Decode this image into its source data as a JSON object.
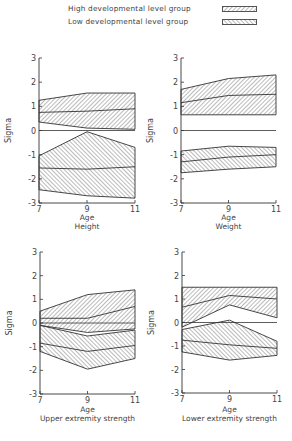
{
  "legend": {
    "items": [
      {
        "label": "High developmental level group",
        "pattern": "forward-hatch"
      },
      {
        "label": "Low developmental level group",
        "pattern": "back-hatch"
      }
    ]
  },
  "colors": {
    "line": "#333333",
    "hatch": "#555555",
    "text": "#444444",
    "background": "#ffffff"
  },
  "chart_data": [
    {
      "type": "area",
      "title": "Height",
      "xlabel": "Age",
      "ylabel": "Sigma",
      "x": [
        7,
        9,
        11
      ],
      "xticks": [
        "7",
        "9",
        "11"
      ],
      "yticks": [
        "3",
        "2",
        "1",
        "0",
        "-1",
        "-2",
        "-3"
      ],
      "ylim": [
        -3,
        3
      ],
      "grid": false,
      "series": [
        {
          "name": "High developmental level group",
          "upper": [
            1.25,
            1.55,
            1.55
          ],
          "mean": [
            0.75,
            0.8,
            0.9
          ],
          "lower": [
            0.35,
            0.1,
            0.05
          ]
        },
        {
          "name": "Low developmental level group",
          "upper": [
            -1.05,
            -0.05,
            -0.7
          ],
          "mean": [
            -1.55,
            -1.6,
            -1.5
          ],
          "lower": [
            -2.45,
            -2.7,
            -2.8
          ]
        }
      ]
    },
    {
      "type": "area",
      "title": "Weight",
      "xlabel": "Age",
      "ylabel": "Sigma",
      "x": [
        7,
        9,
        11
      ],
      "xticks": [
        "7",
        "9",
        "11"
      ],
      "yticks": [
        "3",
        "2",
        "1",
        "0",
        "-1",
        "-2",
        "-3"
      ],
      "ylim": [
        -3,
        3
      ],
      "grid": false,
      "series": [
        {
          "name": "High developmental level group",
          "upper": [
            1.7,
            2.15,
            2.3
          ],
          "mean": [
            1.15,
            1.45,
            1.5
          ],
          "lower": [
            0.65,
            0.65,
            0.65
          ]
        },
        {
          "name": "Low developmental level group",
          "upper": [
            -0.85,
            -0.65,
            -0.7
          ],
          "mean": [
            -1.3,
            -1.1,
            -1.0
          ],
          "lower": [
            -1.75,
            -1.6,
            -1.5
          ]
        }
      ]
    },
    {
      "type": "area",
      "title": "Upper extremity strength",
      "xlabel": "Age",
      "ylabel": "Sigma",
      "x": [
        7,
        9,
        11
      ],
      "xticks": [
        "7",
        "9",
        "11"
      ],
      "yticks": [
        "3",
        "2",
        "1",
        "0",
        "-1",
        "-2",
        "-3"
      ],
      "ylim": [
        -3,
        3
      ],
      "grid": false,
      "series": [
        {
          "name": "High developmental level group",
          "upper": [
            0.5,
            1.2,
            1.4
          ],
          "mean": [
            0.2,
            0.2,
            0.7
          ],
          "lower": [
            -0.1,
            -0.4,
            -0.25
          ]
        },
        {
          "name": "Low developmental level group",
          "upper": [
            -0.1,
            -0.55,
            -0.3
          ],
          "mean": [
            -0.85,
            -1.2,
            -0.95
          ],
          "lower": [
            -1.2,
            -1.95,
            -1.5
          ]
        }
      ]
    },
    {
      "type": "area",
      "title": "Lower extremity strength",
      "xlabel": "Age",
      "ylabel": "Sigma",
      "x": [
        7,
        9,
        11
      ],
      "xticks": [
        "7",
        "9",
        "11"
      ],
      "yticks": [
        "3",
        "2",
        "1",
        "0",
        "-1",
        "-2",
        "-3"
      ],
      "ylim": [
        -3,
        3
      ],
      "grid": false,
      "series": [
        {
          "name": "High developmental level group",
          "upper": [
            1.5,
            1.5,
            1.5
          ],
          "mean": [
            0.65,
            1.15,
            1.0
          ],
          "lower": [
            -0.2,
            0.75,
            0.2
          ]
        },
        {
          "name": "Low developmental level group",
          "upper": [
            -0.3,
            0.1,
            -0.8
          ],
          "mean": [
            -0.75,
            -0.95,
            -1.1
          ],
          "lower": [
            -1.25,
            -1.6,
            -1.4
          ]
        }
      ]
    }
  ]
}
